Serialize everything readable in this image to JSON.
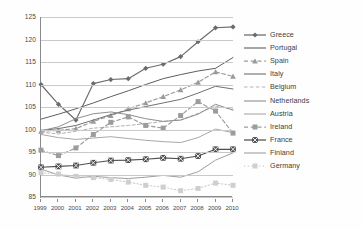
{
  "chart_data": {
    "type": "line",
    "title": "",
    "xlabel": "",
    "ylabel": "",
    "xlim": [
      1999,
      2010
    ],
    "ylim": [
      85,
      125
    ],
    "ytick_step": 5,
    "grid": true,
    "legend_position": "right",
    "x": [
      1999,
      2000,
      2001,
      2002,
      2003,
      2004,
      2005,
      2006,
      2007,
      2008,
      2009,
      2010
    ],
    "xtick_labels": [
      "1999",
      "2000",
      "2001",
      "2002",
      "2003",
      "2004",
      "2005",
      "2006",
      "2007",
      "2008",
      "2009",
      "2010"
    ],
    "ytick_labels": [
      "85",
      "90",
      "95",
      "100",
      "105",
      "110",
      "115",
      "120",
      "125"
    ],
    "series": [
      {
        "name": "Greece",
        "marker": "diamond",
        "dash": "solid",
        "color": "#6b6b6b",
        "values": [
          110.0,
          105.6,
          102.1,
          110.2,
          111.1,
          111.3,
          113.6,
          114.5,
          116.2,
          119.5,
          122.6,
          122.8
        ]
      },
      {
        "name": "Portugal",
        "marker": "none",
        "dash": "solid",
        "color": "#5e5e5e",
        "values": [
          102.3,
          103.4,
          104.6,
          105.9,
          107.3,
          108.6,
          110.0,
          111.3,
          112.2,
          113.0,
          113.6,
          116.0
        ]
      },
      {
        "name": "Spain",
        "marker": "triangle",
        "dash": "dashed",
        "color": "#9a9a9a",
        "values": [
          99.6,
          99.8,
          100.2,
          101.8,
          103.1,
          104.6,
          105.9,
          107.3,
          108.8,
          110.5,
          112.8,
          111.8
        ]
      },
      {
        "name": "Italy",
        "marker": "none",
        "dash": "solid",
        "color": "#707070",
        "values": [
          99.8,
          100.2,
          100.9,
          102.1,
          103.3,
          104.3,
          105.1,
          105.9,
          106.7,
          108.1,
          109.6,
          109.0
        ]
      },
      {
        "name": "Belgium",
        "marker": "none",
        "dash": "dashed",
        "color": "#b4b4b4",
        "values": [
          99.4,
          99.0,
          99.6,
          100.3,
          100.6,
          100.9,
          101.3,
          101.8,
          102.1,
          103.6,
          105.2,
          104.5
        ]
      },
      {
        "name": "Netherlands",
        "marker": "none",
        "dash": "solid",
        "color": "#8e8e8e",
        "values": [
          99.7,
          100.6,
          102.4,
          103.5,
          103.9,
          103.3,
          102.4,
          101.8,
          102.1,
          103.4,
          105.6,
          104.3
        ]
      },
      {
        "name": "Austria",
        "marker": "none",
        "dash": "solid",
        "color": "#a8a8a8",
        "values": [
          98.9,
          98.2,
          97.8,
          98.1,
          98.4,
          98.0,
          97.6,
          97.3,
          97.1,
          98.2,
          100.1,
          99.3
        ]
      },
      {
        "name": "Ireland",
        "marker": "square",
        "dash": "dashed",
        "color": "#9c9c9c",
        "values": [
          95.4,
          94.2,
          95.9,
          98.9,
          101.6,
          102.8,
          100.9,
          100.3,
          103.1,
          106.2,
          104.1,
          99.2
        ]
      },
      {
        "name": "France",
        "marker": "square-x",
        "dash": "solid",
        "color": "#4f4f4f",
        "values": [
          91.6,
          91.8,
          92.0,
          92.6,
          93.1,
          93.2,
          93.4,
          93.7,
          93.5,
          94.1,
          95.6,
          95.6
        ]
      },
      {
        "name": "Finland",
        "marker": "none",
        "dash": "solid",
        "color": "#9e9e9e",
        "values": [
          91.2,
          89.9,
          89.2,
          89.6,
          89.3,
          89.1,
          89.4,
          89.8,
          89.4,
          90.6,
          93.2,
          94.8
        ]
      },
      {
        "name": "Germany",
        "marker": "square",
        "dash": "dotted",
        "color": "#cfcfcf",
        "values": [
          90.4,
          90.1,
          89.6,
          89.3,
          88.9,
          88.3,
          87.6,
          87.2,
          86.4,
          86.9,
          88.1,
          87.6
        ]
      }
    ]
  },
  "legend": {
    "items": [
      {
        "label": "Greece"
      },
      {
        "label": "Portugal"
      },
      {
        "label": "Spain"
      },
      {
        "label": "Italy"
      },
      {
        "label": "Belgium"
      },
      {
        "label": "Netherlands"
      },
      {
        "label": "Austria"
      },
      {
        "label": "Ireland"
      },
      {
        "label": "France"
      },
      {
        "label": "Finland"
      },
      {
        "label": "Germany"
      }
    ]
  }
}
